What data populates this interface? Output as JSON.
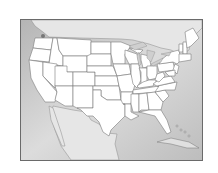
{
  "map": {
    "title": "",
    "subject": "United States (contiguous) state outline map",
    "colors": {
      "ocean": "#bdbdbd",
      "ocean_light": "#e2e2e2",
      "foreign_land": "#e6e6e6",
      "state_fill": "#ffffff",
      "state_border": "#7a7a7a",
      "frame": "#6a6a6a"
    },
    "regions": [
      "United States",
      "Canada",
      "Mexico",
      "Cuba",
      "Bahamas",
      "Gulf of Mexico",
      "Atlantic Ocean",
      "Pacific Ocean",
      "Great Lakes"
    ],
    "labels": []
  }
}
